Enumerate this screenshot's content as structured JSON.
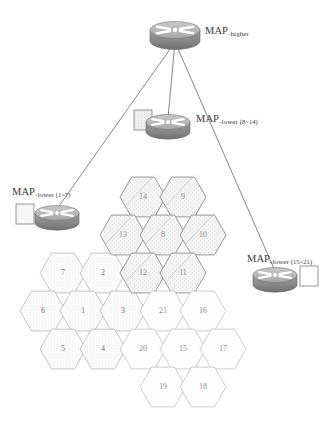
{
  "diagram": {
    "colors": {
      "router_body": "#8c8c8c",
      "router_top": "#b9b9b9",
      "hex_stroke_light": "#b3b3b3",
      "hex_stroke_dark": "#777777",
      "hex_fill_plain": "#fcfcfc",
      "hex_fill_dotted": "#f2f2f2",
      "hex_fill_hatched": "#ededed",
      "line": "#555555",
      "text": "#3a3a3a",
      "hex_number": "#8f8f8f"
    },
    "nodes": [
      {
        "id": "map-higher",
        "label_main": "MAP",
        "label_sub": "-higher",
        "label_paren": "",
        "x": 175,
        "y": 30,
        "label_x": 205,
        "label_y": 20,
        "box": null
      },
      {
        "id": "map-lower-8-14",
        "label_main": "MAP",
        "label_sub": "-lower",
        "label_paren": "(8~14)",
        "x": 168,
        "y": 122,
        "label_x": 196,
        "label_y": 108,
        "box": {
          "x": 134,
          "y": 110,
          "w": 18,
          "h": 20,
          "fill": "hatched"
        }
      },
      {
        "id": "map-lower-1-7",
        "label_main": "MAP",
        "label_sub": "-lower",
        "label_paren": "(1~7)",
        "x": 57,
        "y": 213,
        "label_x": 12,
        "label_y": 181,
        "box": {
          "x": 16,
          "y": 204,
          "w": 18,
          "h": 20,
          "fill": "dotted"
        }
      },
      {
        "id": "map-lower-15-21",
        "label_main": "MAP",
        "label_sub": "-lower",
        "label_paren": "(15~21)",
        "x": 275,
        "y": 275,
        "label_x": 247,
        "label_y": 248,
        "box": {
          "x": 300,
          "y": 266,
          "w": 18,
          "h": 20,
          "fill": "plain"
        }
      }
    ],
    "links": [
      {
        "from": "map-higher",
        "to": "map-lower-1-7"
      },
      {
        "from": "map-higher",
        "to": "map-lower-8-14"
      },
      {
        "from": "map-higher",
        "to": "map-lower-15-21"
      }
    ],
    "clusters": [
      {
        "name": "cluster-1-7",
        "range": "1~7",
        "style": "dotted",
        "cells": [
          {
            "n": "7",
            "cx": 63,
            "cy": 273
          },
          {
            "n": "2",
            "cx": 103,
            "cy": 273
          },
          {
            "n": "6",
            "cx": 43,
            "cy": 311
          },
          {
            "n": "1",
            "cx": 83,
            "cy": 311
          },
          {
            "n": "3",
            "cx": 123,
            "cy": 311
          },
          {
            "n": "5",
            "cx": 63,
            "cy": 349
          },
          {
            "n": "4",
            "cx": 103,
            "cy": 349
          }
        ]
      },
      {
        "name": "cluster-8-14",
        "range": "8~14",
        "style": "hatched",
        "cells": [
          {
            "n": "14",
            "cx": 143,
            "cy": 197
          },
          {
            "n": "9",
            "cx": 183,
            "cy": 197
          },
          {
            "n": "13",
            "cx": 123,
            "cy": 235
          },
          {
            "n": "8",
            "cx": 163,
            "cy": 235
          },
          {
            "n": "10",
            "cx": 203,
            "cy": 235
          },
          {
            "n": "12",
            "cx": 143,
            "cy": 273
          },
          {
            "n": "11",
            "cx": 183,
            "cy": 273
          }
        ]
      },
      {
        "name": "cluster-15-21",
        "range": "15~21",
        "style": "plain",
        "cells": [
          {
            "n": "21",
            "cx": 163,
            "cy": 311
          },
          {
            "n": "16",
            "cx": 203,
            "cy": 311
          },
          {
            "n": "20",
            "cx": 143,
            "cy": 349
          },
          {
            "n": "15",
            "cx": 183,
            "cy": 349
          },
          {
            "n": "17",
            "cx": 223,
            "cy": 349
          },
          {
            "n": "19",
            "cx": 163,
            "cy": 387
          },
          {
            "n": "18",
            "cx": 203,
            "cy": 387
          }
        ]
      }
    ]
  }
}
